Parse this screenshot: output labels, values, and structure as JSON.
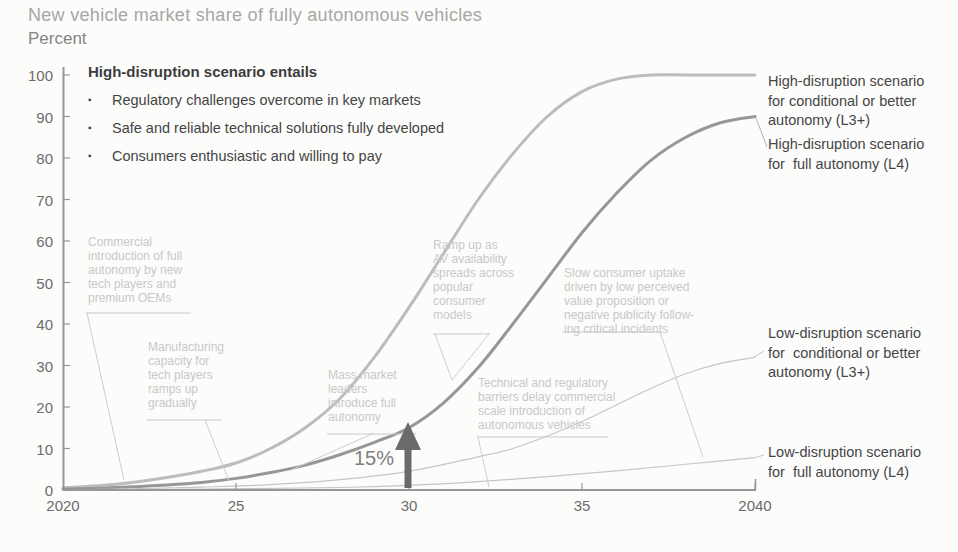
{
  "title": "New vehicle market share of fully autonomous vehicles",
  "unit_label": "Percent",
  "info_box": {
    "heading": "High-disruption scenario entails",
    "bullets": [
      "Regulatory challenges overcome in key markets",
      "Safe and reliable technical solutions fully developed",
      "Consumers enthusiastic and willing to pay"
    ],
    "bullet_icon": "▪"
  },
  "annotations": {
    "commercial_introduction": "Commercial\nintroduction of full\nautonomy by new\ntech players and\npremium OEMs",
    "manufacturing_capacity": "Manufacturing\ncapacity for\ntech players\nramps up\ngradually",
    "mass_market": "Mass market\nleaders\nintroduce full\nautonomy",
    "ramp_up": "Ramp up as\nAV availability\nspreads across\npopular\nconsumer\nmodels",
    "slow_uptake": "Slow consumer uptake\ndriven by low perceived\nvalue proposition or\nnegative publicity follow-\ning critical incidents",
    "technical_barriers": "Technical and regulatory\nbarriers delay commercial\nscale introduction of\nautonomous vehicles"
  },
  "curve_labels": {
    "high_l3plus": "High-disruption scenario\nfor conditional or better\nautonomy (L3+)",
    "high_l4": "High-disruption scenario\nfor  full autonomy (L4)",
    "low_l3plus": "Low-disruption scenario\nfor  conditional or better\nautonomy (L3+)",
    "low_l4": "Low-disruption scenario\nfor  full autonomy (L4)"
  },
  "callout": {
    "label": "15%",
    "year": 2030,
    "value": 15
  },
  "colors": {
    "high_l3plus": "#bcbcbc",
    "high_l4": "#979797",
    "low_curves": "#c6c6c6",
    "axis": "#979797",
    "arrow": "#6b6b6b",
    "annotation_text": "#c8c8c8",
    "label_text": "#464646"
  },
  "chart_data": {
    "type": "line",
    "title": "New vehicle market share of fully autonomous vehicles",
    "xlabel": "",
    "ylabel": "Percent",
    "x_range": [
      2020,
      2040
    ],
    "y_range": [
      0,
      100
    ],
    "grid": false,
    "legend_position": "right",
    "x_ticks": [
      {
        "year": 2020,
        "label": "2020"
      },
      {
        "year": 2025,
        "label": "25"
      },
      {
        "year": 2030,
        "label": "30"
      },
      {
        "year": 2035,
        "label": "35"
      },
      {
        "year": 2040,
        "label": "2040"
      }
    ],
    "y_ticks": [
      {
        "value": 100,
        "label": "100"
      },
      {
        "value": 90,
        "label": "90"
      },
      {
        "value": 80,
        "label": "80"
      },
      {
        "value": 70,
        "label": "70"
      },
      {
        "value": 60,
        "label": "60"
      },
      {
        "value": 50,
        "label": "50"
      },
      {
        "value": 40,
        "label": "40"
      },
      {
        "value": 30,
        "label": "30"
      },
      {
        "value": 20,
        "label": "20"
      },
      {
        "value": 10,
        "label": "10"
      },
      {
        "value": 0,
        "label": "0"
      }
    ],
    "series": [
      {
        "id": "high_l3plus",
        "name": "High-disruption scenario for conditional or better autonomy (L3+)",
        "color": "#bcbcbc",
        "stroke_width": 3,
        "points": [
          [
            2020,
            0.5
          ],
          [
            2021,
            1
          ],
          [
            2022,
            1.8
          ],
          [
            2023,
            3
          ],
          [
            2024,
            4.5
          ],
          [
            2025,
            6.5
          ],
          [
            2026,
            10
          ],
          [
            2027,
            15
          ],
          [
            2028,
            22
          ],
          [
            2029,
            32
          ],
          [
            2030,
            44
          ],
          [
            2031,
            57
          ],
          [
            2032,
            70
          ],
          [
            2033,
            81
          ],
          [
            2034,
            90
          ],
          [
            2035,
            96
          ],
          [
            2036,
            99
          ],
          [
            2037,
            100
          ],
          [
            2038,
            100
          ],
          [
            2039,
            100
          ],
          [
            2040,
            100
          ]
        ]
      },
      {
        "id": "high_l4",
        "name": "High-disruption scenario for full autonomy (L4)",
        "color": "#979797",
        "stroke_width": 3,
        "points": [
          [
            2020,
            0.2
          ],
          [
            2021,
            0.4
          ],
          [
            2022,
            0.8
          ],
          [
            2023,
            1.2
          ],
          [
            2024,
            1.8
          ],
          [
            2025,
            2.8
          ],
          [
            2026,
            4.2
          ],
          [
            2027,
            6
          ],
          [
            2028,
            8.5
          ],
          [
            2029,
            11.5
          ],
          [
            2030,
            15
          ],
          [
            2031,
            21
          ],
          [
            2032,
            29.5
          ],
          [
            2033,
            40
          ],
          [
            2034,
            51
          ],
          [
            2035,
            62
          ],
          [
            2036,
            71.5
          ],
          [
            2037,
            79.5
          ],
          [
            2038,
            85
          ],
          [
            2039,
            88.5
          ],
          [
            2040,
            90
          ]
        ]
      },
      {
        "id": "low_l3plus",
        "name": "Low-disruption scenario for conditional or better autonomy (L3+)",
        "color": "#c6c6c6",
        "stroke_width": 1.2,
        "points": [
          [
            2020,
            0
          ],
          [
            2022,
            0.3
          ],
          [
            2024,
            0.7
          ],
          [
            2026,
            1.3
          ],
          [
            2028,
            2.5
          ],
          [
            2030,
            4.5
          ],
          [
            2032,
            8
          ],
          [
            2033,
            10
          ],
          [
            2034,
            13
          ],
          [
            2035,
            16.5
          ],
          [
            2036,
            20.5
          ],
          [
            2037,
            24.5
          ],
          [
            2038,
            28
          ],
          [
            2039,
            30.5
          ],
          [
            2040,
            32
          ]
        ]
      },
      {
        "id": "low_l4",
        "name": "Low-disruption scenario for full autonomy (L4)",
        "color": "#c6c6c6",
        "stroke_width": 1.2,
        "points": [
          [
            2020,
            0
          ],
          [
            2024,
            0.2
          ],
          [
            2028,
            0.6
          ],
          [
            2030,
            1.1
          ],
          [
            2032,
            2
          ],
          [
            2034,
            3.2
          ],
          [
            2036,
            4.6
          ],
          [
            2038,
            6.2
          ],
          [
            2040,
            7.8
          ]
        ]
      }
    ],
    "annotation_arrow": {
      "year": 2030,
      "value_pointed": 15,
      "label": "15%",
      "series": "high_l4"
    }
  }
}
